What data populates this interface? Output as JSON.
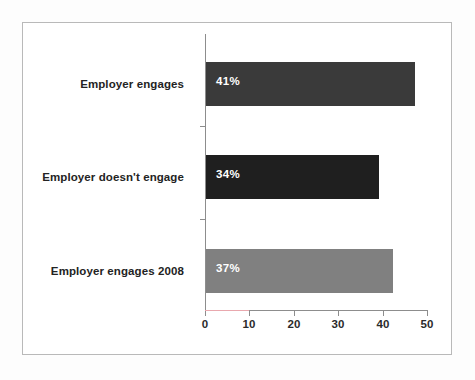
{
  "chart_data": {
    "type": "bar",
    "orientation": "horizontal",
    "title": "",
    "subtitle": "",
    "xlabel": "",
    "ylabel": "",
    "categories": [
      "Employer engages",
      "Employer doesn't engage",
      "Employer engages 2008"
    ],
    "values": [
      47.3,
      39.2,
      42.3
    ],
    "data_labels": [
      "41%",
      "34%",
      "37%"
    ],
    "bar_colors": [
      "#3a3a3a",
      "#1f1f1f",
      "#808080"
    ],
    "xlim": [
      0,
      50
    ],
    "xticks": [
      0,
      10,
      20,
      30,
      40,
      50
    ],
    "xtick_labels": [
      "0",
      "10",
      "20",
      "30",
      "40",
      "50"
    ],
    "grid": false,
    "legend": false,
    "legend_position": "none",
    "series": [
      {
        "name": "",
        "points": [
          {
            "category": "Employer engages",
            "value": 47.3,
            "label": "41%",
            "color": "#3a3a3a"
          },
          {
            "category": "Employer doesn't engage",
            "value": 39.2,
            "label": "34%",
            "color": "#1f1f1f"
          },
          {
            "category": "Employer engages 2008",
            "value": 42.3,
            "label": "37%",
            "color": "#808080"
          }
        ]
      }
    ]
  },
  "colors": {
    "frame_border": "#b9b9b9",
    "axis_line": "#8d8d8d",
    "axis_tint": "#e9a8ae",
    "tick_label": "#2b2b2b",
    "category_label": "#232323",
    "data_label": "#ffffff",
    "plot_background": "#ffffff",
    "page_background": "#f2f2f2"
  }
}
